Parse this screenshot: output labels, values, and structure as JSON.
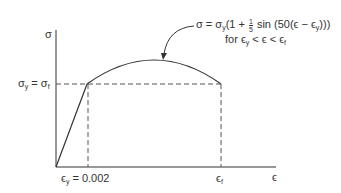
{
  "diagram": {
    "type": "stress-strain curve",
    "axes": {
      "y_label": "σ",
      "x_label": "ϵ"
    },
    "labels": {
      "yield_stress": {
        "left": "σ",
        "left_sub": "y",
        "eq": " = ",
        "right": "σ",
        "right_sub": "f"
      },
      "yield_strain": {
        "sym": "ϵ",
        "sub": "y",
        "eq": " = 0.002"
      },
      "failure_strain": {
        "sym": "ϵ",
        "sub": "f"
      }
    },
    "equation": {
      "line1_a": "σ = σ",
      "line1_a_sub": "y",
      "line1_b": "(1 + ",
      "frac_num": "1",
      "frac_den": "5",
      "line1_c": " sin (50(ϵ − ϵ",
      "line1_c_sub": "y",
      "line1_d": ")))",
      "line2_a": "for ϵ",
      "line2_a_sub": "y",
      "line2_b": " < ϵ < ϵ",
      "line2_b_sub": "f"
    },
    "colors": {
      "line": "#333333",
      "dashed": "#555555"
    }
  }
}
